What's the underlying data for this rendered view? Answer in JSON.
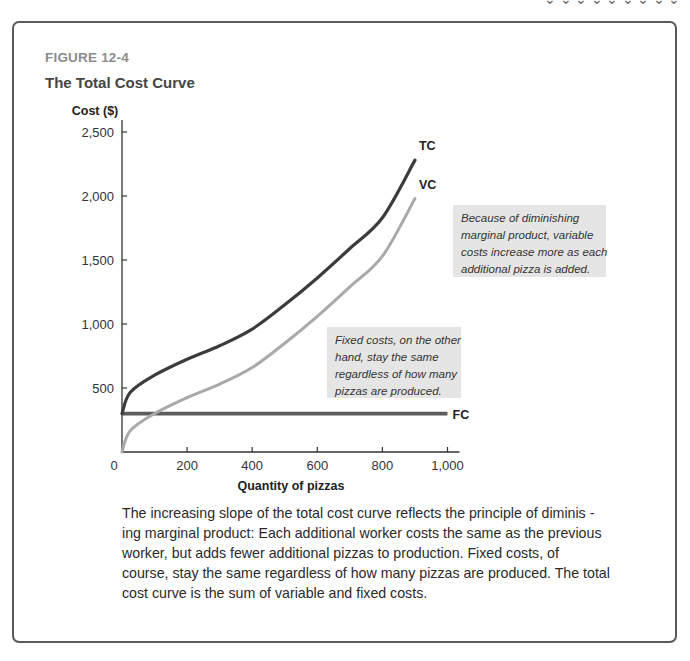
{
  "page": {
    "cropped_top_text": "⌄ ⌄ ⌄ ⌄ ⌄ ⌄ ⌄ ⌄ ⌄"
  },
  "figure": {
    "label": "FIGURE 12-4",
    "title": "The Total Cost Curve",
    "caption_lines": [
      "The increasing slope of the total cost curve reflects the principle of diminis  -",
      "ing marginal product: Each additional worker costs the same as the previous",
      "worker, but adds fewer additional pizzas to production. Fixed costs, of",
      "course, stay the same regardless of how many pizzas are produced. The total",
      "cost curve is the sum of variable and fixed costs."
    ],
    "annotations": {
      "variable_costs_note": [
        "Because of diminishing",
        "marginal product, variable",
        "costs increase more as each",
        "additional pizza is added."
      ],
      "fixed_costs_note": [
        "Fixed costs, on the other",
        "hand, stay the same",
        "regardless of how many",
        "pizzas are produced."
      ]
    },
    "colors": {
      "frame": "#5a5a5a",
      "tc": "#3c3c3c",
      "vc": "#a9a9a9",
      "fc": "#5c5c5c",
      "axis": "#333333",
      "note_bg": "#e5e5e5",
      "label_gray": "#8c8c8c"
    }
  },
  "chart_data": {
    "type": "line",
    "title": "The Total Cost Curve",
    "xlabel": "Quantity of  pizzas",
    "ylabel": "Cost ($)",
    "xlim": [
      0,
      1000
    ],
    "ylim": [
      0,
      2500
    ],
    "x_ticks": [
      0,
      200,
      400,
      600,
      800,
      1000
    ],
    "x_tick_labels": [
      "0",
      "200",
      "400",
      "600",
      "800",
      "1,000"
    ],
    "y_ticks": [
      500,
      1000,
      1500,
      2000,
      2500
    ],
    "y_tick_labels": [
      "500",
      "1,000",
      "1,500",
      "2,000",
      "2,500"
    ],
    "grid": false,
    "legend": "inline labels at line ends",
    "x": [
      0,
      100,
      200,
      300,
      400,
      500,
      600,
      700,
      800,
      900
    ],
    "series": [
      {
        "name": "TC",
        "values": [
          300,
          600,
          725,
          830,
          960,
          1150,
          1360,
          1590,
          1830,
          2280
        ]
      },
      {
        "name": "VC",
        "values": [
          0,
          300,
          425,
          530,
          660,
          850,
          1060,
          1290,
          1530,
          1980
        ]
      },
      {
        "name": "FC",
        "values": [
          300,
          300,
          300,
          300,
          300,
          300,
          300,
          300,
          300,
          300
        ],
        "extends_to_x": 1000
      }
    ]
  }
}
